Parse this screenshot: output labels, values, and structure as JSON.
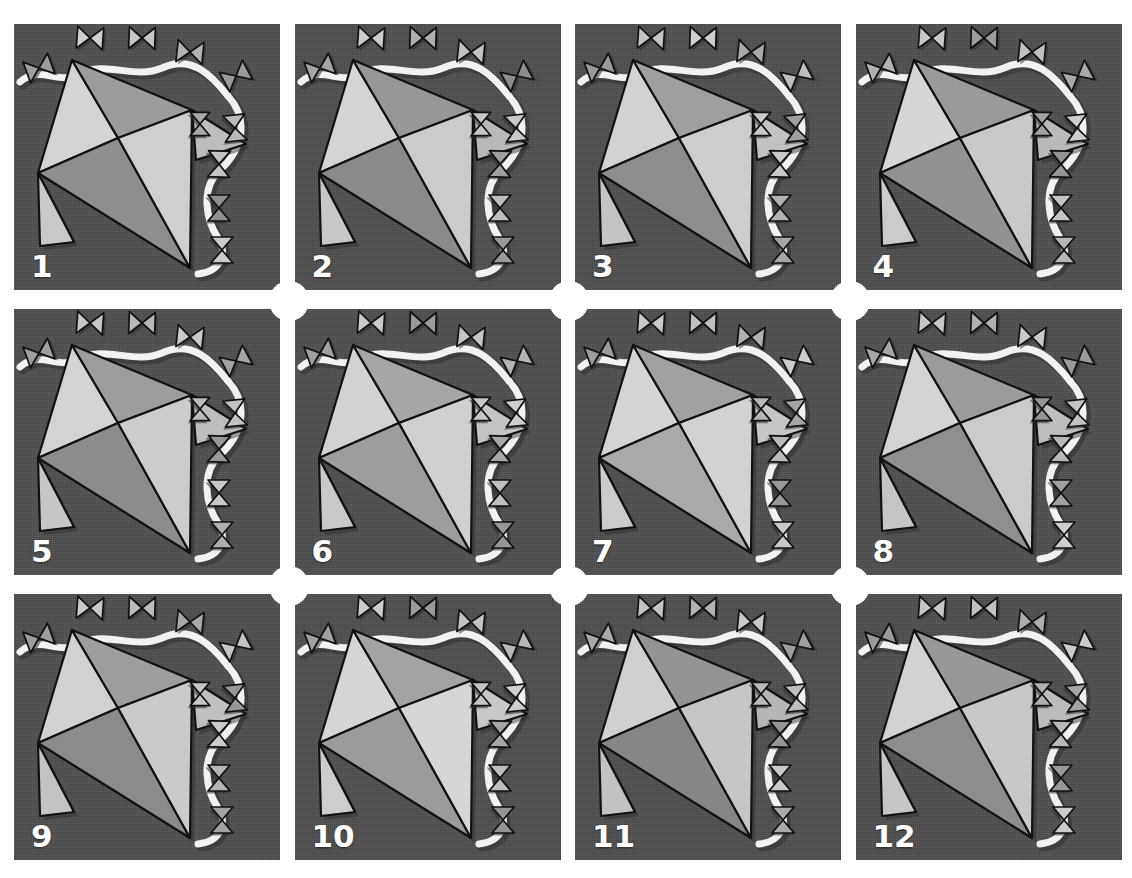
{
  "header": {
    "caption": "",
    "caption_visible": false
  },
  "figure": {
    "type": "panel-grid",
    "rows": 3,
    "columns": 4,
    "panel_count": 12,
    "panel_background_color": "#4d4d4d",
    "page_background_color": "#ffffff",
    "label_color": "#ffffff",
    "outline_color": "#111111",
    "ribbon_color": "#f2f2f2",
    "shadow_color": "#2b2b2b"
  },
  "palette": {
    "very_light": "#dcdcdc",
    "light": "#cfcfcf",
    "light_mid": "#bdbdbd",
    "mid": "#9a9a9a",
    "mid_dark": "#868686",
    "dark": "#6f6f6f",
    "marker_light": "#d2d2d2",
    "marker_mid": "#a6a6a6",
    "marker_dark": "#7c7c7c"
  },
  "kite": {
    "description": "quadrilateral mesh of four triangles with a central vertex",
    "vertices": {
      "top": [
        58,
        36
      ],
      "right": [
        178,
        86
      ],
      "bottom": [
        176,
        244
      ],
      "left": [
        24,
        149
      ],
      "center": [
        104,
        114
      ]
    },
    "spurs": [
      {
        "name": "left-spur",
        "points": "24,149 26,222 60,218"
      },
      {
        "name": "right-upper-spur",
        "points": "178,86 232,120 182,136"
      }
    ]
  },
  "markers": {
    "bowtie_count_per_panel": 10,
    "orientation_note": "vertical bowties along the top ribbon, horizontal bowties along the right ribbon",
    "positions": [
      {
        "id": "m1",
        "x": 25,
        "y": 44,
        "rot": -20,
        "scale": 1.0
      },
      {
        "id": "m2",
        "x": 76,
        "y": 14,
        "rot": 4,
        "scale": 1.0
      },
      {
        "id": "m3",
        "x": 128,
        "y": 14,
        "rot": 2,
        "scale": 1.0
      },
      {
        "id": "m4",
        "x": 176,
        "y": 28,
        "rot": 6,
        "scale": 1.0
      },
      {
        "id": "m5",
        "x": 222,
        "y": 52,
        "rot": -28,
        "scale": 1.0
      },
      {
        "id": "m6",
        "x": 221,
        "y": 104,
        "rot": 84,
        "scale": 1.0
      },
      {
        "id": "m7",
        "x": 205,
        "y": 140,
        "rot": 92,
        "scale": 1.0
      },
      {
        "id": "m8",
        "x": 205,
        "y": 184,
        "rot": 90,
        "scale": 1.0
      },
      {
        "id": "m9",
        "x": 208,
        "y": 226,
        "rot": 90,
        "scale": 1.0
      },
      {
        "id": "m10",
        "x": 186,
        "y": 100,
        "rot": 90,
        "scale": 0.9
      }
    ]
  },
  "ribbon": {
    "top_path": "M 6,58 C 26,40 44,62 66,50 C 92,36 120,56 148,44 C 178,30 198,52 214,72",
    "right_path": "M 214,72 C 236,96 228,126 206,146 C 186,164 192,196 204,214 C 214,230 206,248 184,250"
  },
  "panels": [
    {
      "number": "1",
      "fills": {
        "top_left": "#d4d4d4",
        "top_right": "#9c9c9c",
        "bottom_left": "#8e8e8e",
        "bottom_right": "#cfcfcf"
      },
      "spur_fills": {
        "left": "#c9c9c9",
        "right": "#bdbdbd"
      },
      "marker_tones": [
        "#9d9d9d",
        "#cfcfcf",
        "#c6c6c6",
        "#b4b4b4",
        "#9a9a9a",
        "#b9b9b9",
        "#c4c4c4",
        "#8f8f8f",
        "#cccccc",
        "#a8a8a8"
      ]
    },
    {
      "number": "2",
      "fills": {
        "top_left": "#d4d4d4",
        "top_right": "#979797",
        "bottom_left": "#8a8a8a",
        "bottom_right": "#cbcbcb"
      },
      "spur_fills": {
        "left": "#c7c7c7",
        "right": "#b9b9b9"
      },
      "marker_tones": [
        "#a4a4a4",
        "#cbcbcb",
        "#b0b0b0",
        "#c2c2c2",
        "#8d8d8d",
        "#c8c8c8",
        "#a0a0a0",
        "#bfbfbf",
        "#9a9a9a",
        "#c6c6c6"
      ]
    },
    {
      "number": "3",
      "fills": {
        "top_left": "#d2d2d2",
        "top_right": "#9f9f9f",
        "bottom_left": "#8d8d8d",
        "bottom_right": "#cdcdcd"
      },
      "spur_fills": {
        "left": "#c4c4c4",
        "right": "#c2c2c2"
      },
      "marker_tones": [
        "#9a9a9a",
        "#c4c4c4",
        "#cfcfcf",
        "#a9a9a9",
        "#bdbdbd",
        "#9f9f9f",
        "#cacaca",
        "#b3b3b3",
        "#a6a6a6",
        "#c9c9c9"
      ]
    },
    {
      "number": "4",
      "fills": {
        "top_left": "#d6d6d6",
        "top_right": "#9a9a9a",
        "bottom_left": "#929292",
        "bottom_right": "#c9c9c9"
      },
      "spur_fills": {
        "left": "#cbcbcb",
        "right": "#bababa"
      },
      "marker_tones": [
        "#b2b2b2",
        "#c9c9c9",
        "#9d9d9d",
        "#c0c0c0",
        "#a9a9a9",
        "#cdcdcd",
        "#949494",
        "#c4c4c4",
        "#b6b6b6",
        "#a2a2a2"
      ]
    },
    {
      "number": "5",
      "fills": {
        "top_left": "#d3d3d3",
        "top_right": "#9d9d9d",
        "bottom_left": "#8c8c8c",
        "bottom_right": "#cccccc"
      },
      "spur_fills": {
        "left": "#c6c6c6",
        "right": "#bebebe"
      },
      "marker_tones": [
        "#9f9f9f",
        "#c7c7c7",
        "#b8b8b8",
        "#cacaca",
        "#a4a4a4",
        "#c1c1c1",
        "#999999",
        "#c8c8c8",
        "#aeaeae",
        "#bcbcbc"
      ]
    },
    {
      "number": "6",
      "fills": {
        "top_left": "#d2d2d2",
        "top_right": "#a6a6a6",
        "bottom_left": "#9d9d9d",
        "bottom_right": "#d0d0d0"
      },
      "spur_fills": {
        "left": "#c9c9c9",
        "right": "#c4c4c4"
      },
      "marker_tones": [
        "#a0a0a0",
        "#cacaca",
        "#9b9b9b",
        "#c5c5c5",
        "#b4b4b4",
        "#cecece",
        "#a8a8a8",
        "#bfbfbf",
        "#969696",
        "#c7c7c7"
      ]
    },
    {
      "number": "7",
      "fills": {
        "top_left": "#d4d4d4",
        "top_right": "#a1a1a1",
        "bottom_left": "#a9a9a9",
        "bottom_right": "#d2d2d2"
      },
      "spur_fills": {
        "left": "#cbcbcb",
        "right": "#c6c6c6"
      },
      "marker_tones": [
        "#9c9c9c",
        "#c8c8c8",
        "#c0c0c0",
        "#b2b2b2",
        "#cccccc",
        "#a5a5a5",
        "#bababa",
        "#989898",
        "#c9c9c9",
        "#b7b7b7"
      ]
    },
    {
      "number": "8",
      "fills": {
        "top_left": "#d3d3d3",
        "top_right": "#9b9b9b",
        "bottom_left": "#8f8f8f",
        "bottom_right": "#cbcbcb"
      },
      "spur_fills": {
        "left": "#c5c5c5",
        "right": "#bdbdbd"
      },
      "marker_tones": [
        "#a6a6a6",
        "#c6c6c6",
        "#b1b1b1",
        "#cacaca",
        "#9a9a9a",
        "#c2c2c2",
        "#b8b8b8",
        "#a0a0a0",
        "#cdcdcd",
        "#949494"
      ]
    },
    {
      "number": "9",
      "fills": {
        "top_left": "#d1d1d1",
        "top_right": "#9e9e9e",
        "bottom_left": "#8b8b8b",
        "bottom_right": "#cacaca"
      },
      "spur_fills": {
        "left": "#c3c3c3",
        "right": "#c0c0c0"
      },
      "marker_tones": [
        "#9d9d9d",
        "#c9c9c9",
        "#bcbcbc",
        "#a8a8a8",
        "#c4c4c4",
        "#979797",
        "#cbcbcb",
        "#b5b5b5",
        "#a2a2a2",
        "#c6c6c6"
      ]
    },
    {
      "number": "10",
      "fills": {
        "top_left": "#d5d5d5",
        "top_right": "#a3a3a3",
        "bottom_left": "#9b9b9b",
        "bottom_right": "#d6d6d6"
      },
      "spur_fills": {
        "left": "#cdcdcd",
        "right": "#c8c8c8"
      },
      "marker_tones": [
        "#a1a1a1",
        "#cccccc",
        "#9a9a9a",
        "#c3c3c3",
        "#b7b7b7",
        "#cfcfcf",
        "#a6a6a6",
        "#bebebe",
        "#939393",
        "#c5c5c5"
      ]
    },
    {
      "number": "11",
      "fills": {
        "top_left": "#d0d0d0",
        "top_right": "#949494",
        "bottom_left": "#868686",
        "bottom_right": "#c6c6c6"
      },
      "spur_fills": {
        "left": "#c2c2c2",
        "right": "#b6b6b6"
      },
      "marker_tones": [
        "#a9a9a9",
        "#c4c4c4",
        "#b3b3b3",
        "#c8c8c8",
        "#9e9e9e",
        "#bfbfbf",
        "#969696",
        "#cacaca",
        "#aaaaaa",
        "#bbbbbb"
      ]
    },
    {
      "number": "12",
      "fills": {
        "top_left": "#d2d2d2",
        "top_right": "#989898",
        "bottom_left": "#8d8d8d",
        "bottom_right": "#c8c8c8"
      },
      "spur_fills": {
        "left": "#c6c6c6",
        "right": "#bcbcbc"
      },
      "marker_tones": [
        "#9b9b9b",
        "#c7c7c7",
        "#c1c1c1",
        "#adadad",
        "#cacaca",
        "#a3a3a3",
        "#b9b9b9",
        "#999999",
        "#cccccc",
        "#b0b0b0"
      ]
    }
  ]
}
